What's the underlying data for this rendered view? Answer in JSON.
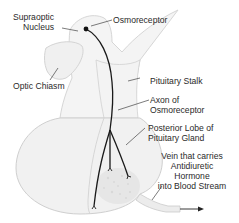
{
  "diagram": {
    "labels": {
      "supraoptic_nucleus": [
        "Supraoptic",
        "Nucleus"
      ],
      "osmoreceptor": "Osmoreceptor",
      "optic_chiasm": "Optic Chiasm",
      "pituitary_stalk": "Pituitary Stalk",
      "axon_of_osmoreceptor": [
        "Axon of",
        "Osmoreceptor"
      ],
      "posterior_lobe": [
        "Posterior Lobe of",
        "Pituitary Gland"
      ],
      "vein": [
        "Vein that carries",
        "Antidiuretic",
        "Hormone",
        "into Blood Stream"
      ]
    },
    "colors": {
      "tissue_fill": "#f2f2f2",
      "tissue_outline": "#cfcfcf",
      "axon": "#1a1a1a",
      "label_text": "#2a2a2a",
      "leader_line": "#444444"
    }
  }
}
